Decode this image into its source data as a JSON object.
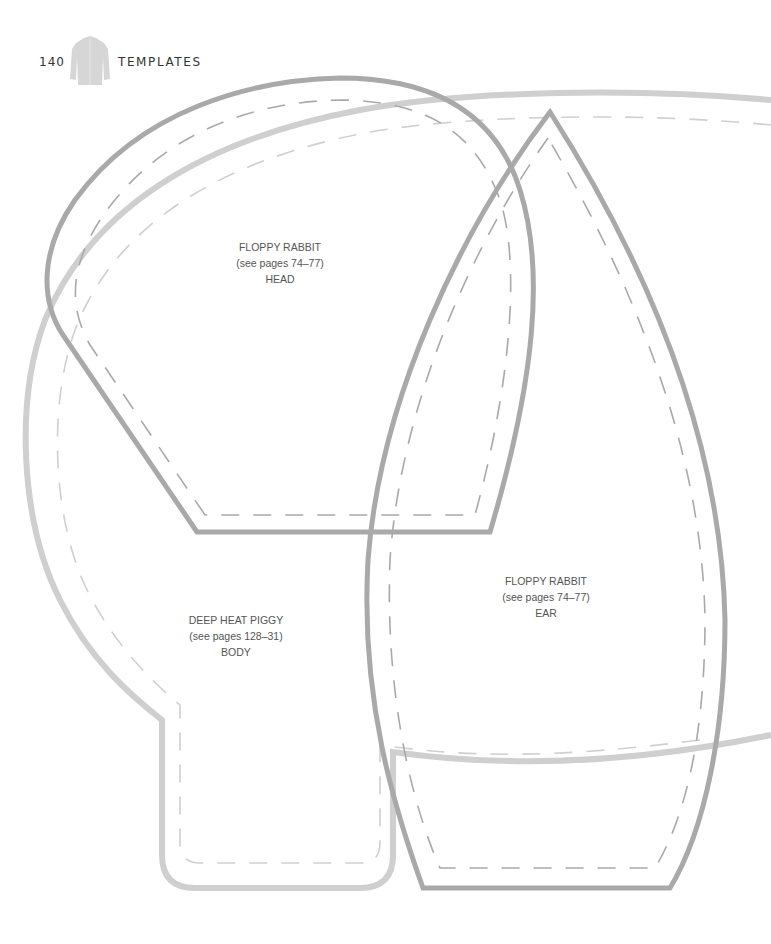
{
  "header": {
    "page_number": "140",
    "section_title": "TEMPLATES",
    "icon": "shirt-icon"
  },
  "colors": {
    "outline_dark": "#a9a9a9",
    "outline_light": "#cfcfcf",
    "text": "#555555",
    "header_text": "#333333"
  },
  "templates": [
    {
      "name": "FLOPPY RABBIT",
      "pages": "(see pages 74–77)",
      "part": "HEAD"
    },
    {
      "name": "FLOPPY RABBIT",
      "pages": "(see pages 74–77)",
      "part": "EAR"
    },
    {
      "name": "DEEP HEAT PIGGY",
      "pages": "(see pages 128–31)",
      "part": "BODY"
    }
  ]
}
